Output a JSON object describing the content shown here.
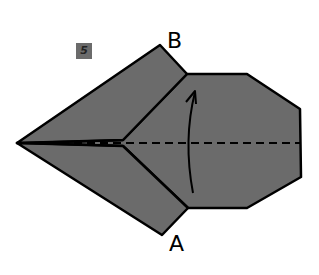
{
  "diagram": {
    "type": "origami-fold-instruction",
    "step_number": "5",
    "labels": {
      "top_point": "B",
      "bottom_point": "A"
    },
    "colors": {
      "paper": "#6b6b6b",
      "outline": "#000000",
      "background": "#ffffff",
      "badge": "#6b6b6b"
    },
    "annotations": {
      "fold_line": "dashed horizontal valley fold through center",
      "arrow": "curved arrow pointing up, fold bottom half up to top"
    }
  }
}
